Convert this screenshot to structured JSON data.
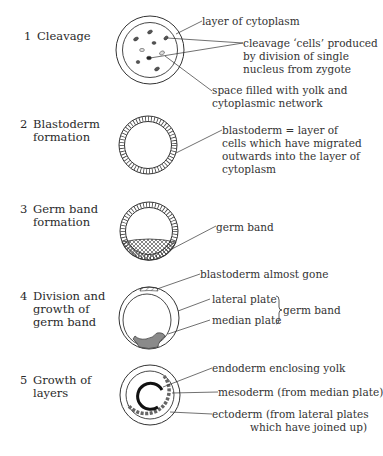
{
  "figure": {
    "stages": [
      {
        "number": "1",
        "title_line1": "Cleavage",
        "title_line2": "",
        "title_line3": "",
        "annotations": [
          "layer of cytoplasm",
          "cleavage ‘cells’ produced",
          "by division of single",
          "nucleus from zygote",
          "space filled with yolk and",
          "cytoplasmic network"
        ]
      },
      {
        "number": "2",
        "title_line1": "Blastoderm",
        "title_line2": "formation",
        "title_line3": "",
        "annotations": [
          "blastoderm = layer of",
          "cells which have migrated",
          "outwards into the layer of",
          "cytoplasm"
        ]
      },
      {
        "number": "3",
        "title_line1": "Germ band",
        "title_line2": "formation",
        "title_line3": "",
        "annotations": [
          "germ band"
        ]
      },
      {
        "number": "4",
        "title_line1": "Division and",
        "title_line2": "growth of",
        "title_line3": "germ band",
        "annotations": [
          "blastoderm almost gone",
          "lateral plate",
          "median plate",
          "germ band"
        ]
      },
      {
        "number": "5",
        "title_line1": "Growth of",
        "title_line2": "layers",
        "title_line3": "",
        "annotations": [
          "endoderm enclosing yolk",
          "mesoderm (from median plate)",
          "ectoderm (from lateral plates",
          "which have joined up)"
        ]
      }
    ],
    "colors": {
      "ink": "#2a2a2a",
      "shade": "#888888",
      "background": "#ffffff"
    }
  }
}
